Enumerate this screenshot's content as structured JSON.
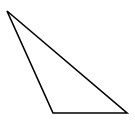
{
  "diagram": {
    "type": "triangle",
    "stroke_color": "#000000",
    "fill_color": "none",
    "stroke_width": 1.6,
    "background": "#ffffff",
    "vertices": [
      {
        "x": 7,
        "y": 11
      },
      {
        "x": 53,
        "y": 113
      },
      {
        "x": 127,
        "y": 113
      }
    ]
  }
}
